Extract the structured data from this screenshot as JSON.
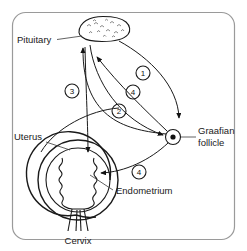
{
  "diagram": {
    "frame_color": "#9a9a9a",
    "ink_color": "#1a1a1a",
    "labels": {
      "pituitary": "Pituitary",
      "graafian_line1": "Graafian",
      "graafian_line2": "follicle",
      "uterus": "Uterus",
      "endometrium": "Endometrium",
      "cervix": "Cervix"
    },
    "markers": [
      {
        "id": "m1",
        "label": "1",
        "x": 143,
        "y": 73
      },
      {
        "id": "m2",
        "label": "4",
        "x": 133,
        "y": 92
      },
      {
        "id": "m3",
        "label": "3",
        "x": 72,
        "y": 91
      },
      {
        "id": "m4",
        "label": "2",
        "x": 119,
        "y": 111
      },
      {
        "id": "m5",
        "label": "4",
        "x": 139,
        "y": 172
      }
    ],
    "arrows": [
      {
        "id": "a1",
        "marker": "1",
        "from": "pituitary",
        "to": "graafian-follicle"
      },
      {
        "id": "a2",
        "marker": "4",
        "from": "graafian-follicle",
        "to": "pituitary"
      },
      {
        "id": "a3",
        "marker": "3",
        "from": "graafian-follicle",
        "to": "pituitary"
      },
      {
        "id": "a4",
        "marker": "2",
        "from": "pituitary",
        "to": "graafian-follicle"
      },
      {
        "id": "a5",
        "marker": "4",
        "from": "graafian-follicle",
        "to": "endometrium"
      }
    ]
  }
}
